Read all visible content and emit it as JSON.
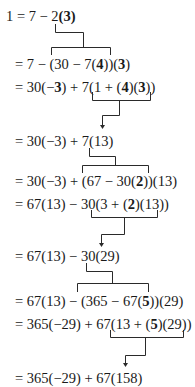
{
  "derivation": {
    "title": "Back-substitution in the Euclidean algorithm",
    "lines": [
      {
        "parts": [
          {
            "t": "1 = 7 − 2"
          },
          {
            "t": "(3)",
            "b": true
          }
        ],
        "x": 6,
        "y": 8
      },
      {
        "parts": [
          {
            "t": "= 7 − (30 − 7("
          },
          {
            "t": "4",
            "b": true
          },
          {
            "t": "))("
          },
          {
            "t": "3",
            "b": true
          },
          {
            "t": ")"
          }
        ],
        "x": 15,
        "y": 56
      },
      {
        "parts": [
          {
            "t": "= 30(−"
          },
          {
            "t": "3",
            "b": true
          },
          {
            "t": ") + 7(1 + ("
          },
          {
            "t": "4",
            "b": true
          },
          {
            "t": ")("
          },
          {
            "t": "3",
            "b": true
          },
          {
            "t": "))"
          }
        ],
        "x": 15,
        "y": 79
      },
      {
        "parts": [
          {
            "t": "= 30(−3) + 7(13)"
          }
        ],
        "x": 15,
        "y": 133
      },
      {
        "parts": [
          {
            "t": "= 30(−3) + (67 − 30("
          },
          {
            "t": "2",
            "b": true
          },
          {
            "t": "))(13)"
          }
        ],
        "x": 15,
        "y": 173
      },
      {
        "parts": [
          {
            "t": "= 67(13) − 30(3 + ("
          },
          {
            "t": "2",
            "b": true
          },
          {
            "t": ")(13))"
          }
        ],
        "x": 15,
        "y": 196
      },
      {
        "parts": [
          {
            "t": "= 67(13) − 30(29)"
          }
        ],
        "x": 15,
        "y": 248
      },
      {
        "parts": [
          {
            "t": "= 67(13) − (365 − 67("
          },
          {
            "t": "5",
            "b": true
          },
          {
            "t": "))(29)"
          }
        ],
        "x": 15,
        "y": 293
      },
      {
        "parts": [
          {
            "t": "= 365(−29) + 67(13 + ("
          },
          {
            "t": "5",
            "b": true
          },
          {
            "t": ")(29))"
          }
        ],
        "x": 15,
        "y": 316
      },
      {
        "parts": [
          {
            "t": "= 365(−29) + 67(158)"
          }
        ],
        "x": 15,
        "y": 370
      }
    ]
  },
  "connectors": [
    {
      "type": "substitute",
      "from_x": 55,
      "from_y": 24,
      "mid_y": 32,
      "stem_x": 83,
      "bar_y": 47,
      "bar_x1": 51,
      "bar_x2": 110,
      "tick_y": 55
    },
    {
      "type": "simplify",
      "bar_y": 100,
      "bar_x1": 92,
      "bar_x2": 150,
      "tick_top": 92,
      "stem_x": 119,
      "mid_y": 115,
      "arrow_x": 102,
      "arrow_y": 129
    },
    {
      "type": "substitute",
      "from_x": 89,
      "from_y": 148,
      "mid_y": 156,
      "stem_x": 115,
      "bar_y": 165,
      "bar_x1": 82,
      "bar_x2": 148,
      "tick_y": 173
    },
    {
      "type": "simplify",
      "bar_y": 217,
      "bar_x1": 91,
      "bar_x2": 157,
      "tick_top": 210,
      "stem_x": 124,
      "mid_y": 234,
      "arrow_x": 101,
      "arrow_y": 247
    },
    {
      "type": "substitute",
      "from_x": 86,
      "from_y": 263,
      "mid_y": 271,
      "stem_x": 112,
      "bar_y": 283,
      "bar_x1": 77,
      "bar_x2": 148,
      "tick_y": 292
    },
    {
      "type": "simplify",
      "bar_y": 337,
      "bar_x1": 110,
      "bar_x2": 183,
      "tick_top": 330,
      "stem_x": 145,
      "mid_y": 355,
      "arrow_x": 125,
      "arrow_y": 367
    }
  ]
}
